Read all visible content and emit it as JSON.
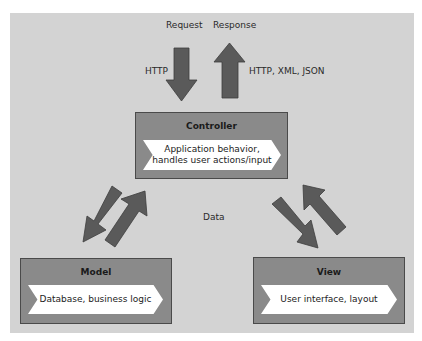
{
  "diagram": {
    "colors": {
      "background": "#d3d3d3",
      "box_fill": "#8a8a8a",
      "box_border": "#4a4a4a",
      "arrow_fill": "#5a5a5a",
      "chevron_fill": "#ffffff"
    },
    "top_labels": {
      "request": "Request",
      "response": "Response",
      "http_in": "HTTP",
      "http_out": "HTTP, XML, JSON"
    },
    "center_label": "Data",
    "controller": {
      "title": "Controller",
      "description_line1": "Application behavior,",
      "description_line2": "handles user actions/input"
    },
    "model": {
      "title": "Model",
      "description": "Database, business logic"
    },
    "view": {
      "title": "View",
      "description": "User interface, layout"
    },
    "arrows": [
      {
        "from": "client",
        "to": "controller",
        "label": "HTTP",
        "direction": "down"
      },
      {
        "from": "controller",
        "to": "client",
        "label": "HTTP, XML, JSON",
        "direction": "up"
      },
      {
        "from": "controller",
        "to": "model",
        "direction": "down-left"
      },
      {
        "from": "model",
        "to": "controller",
        "direction": "up-right"
      },
      {
        "from": "controller",
        "to": "view",
        "direction": "down-right"
      },
      {
        "from": "view",
        "to": "controller",
        "direction": "up-left"
      }
    ]
  }
}
